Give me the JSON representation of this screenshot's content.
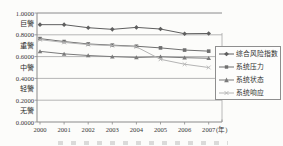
{
  "figure": {
    "background": "#fcfcfa",
    "gridline_color": "#a3a3a3",
    "axis_color": "#8a8a8a",
    "text_color": "#383838"
  },
  "chart_data": {
    "type": "line",
    "title": "",
    "xlabel": "",
    "ylabel": "",
    "x_categories": [
      "2000",
      "2001",
      "2002",
      "2003",
      "2004",
      "2005",
      "2006",
      "2007"
    ],
    "x_axis_suffix": "(年)",
    "y_ticks": [
      "1.0000",
      "0.8000",
      "0.6000",
      "0.4000",
      "0.2000",
      "0.0000"
    ],
    "y_tick_values": [
      1.0,
      0.8,
      0.6,
      0.4,
      0.2,
      0.0
    ],
    "y_band_labels": [
      "巨警",
      "重警",
      "中警",
      "轻警",
      "无警"
    ],
    "ylim": [
      0,
      1
    ],
    "grid": true,
    "legend_position": "right",
    "series": [
      {
        "name": "综合风险指数",
        "marker": "diamond",
        "color": "#5f5f5f",
        "values": [
          0.893,
          0.893,
          0.865,
          0.85,
          0.868,
          0.853,
          0.81,
          0.812
        ]
      },
      {
        "name": "系统压力",
        "marker": "square",
        "color": "#6f6f6f",
        "values": [
          0.765,
          0.738,
          0.716,
          0.705,
          0.695,
          0.68,
          0.66,
          0.65
        ]
      },
      {
        "name": "系统状态",
        "marker": "triangle",
        "color": "#7a7a7a",
        "values": [
          0.648,
          0.625,
          0.61,
          0.6,
          0.592,
          0.598,
          0.59,
          0.585
        ]
      },
      {
        "name": "系统响应",
        "marker": "x",
        "color": "#b4b4b4",
        "values": [
          0.755,
          0.73,
          0.71,
          0.7,
          0.69,
          0.575,
          0.53,
          0.5
        ]
      }
    ]
  }
}
